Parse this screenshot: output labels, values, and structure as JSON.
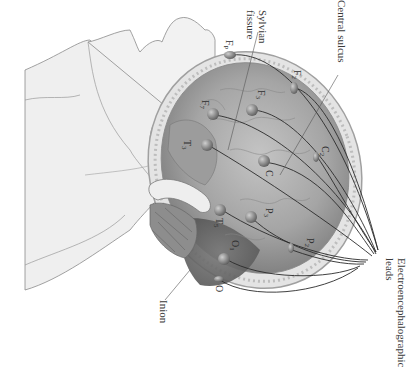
{
  "diagram": {
    "orientation": "rotated 90 degrees clockwise",
    "annotations": [
      {
        "id": "central-sulcus",
        "label": "Central sulcus"
      },
      {
        "id": "sylvian-fissure",
        "label": "Sylvian fissure",
        "lines": [
          "Sylvian",
          "fissure"
        ]
      },
      {
        "id": "eeg-leads",
        "label": "Electroencephalographic leads",
        "lines": [
          "Electroencephalographic",
          "leads"
        ]
      },
      {
        "id": "inion",
        "label": "Inion"
      }
    ],
    "electrodes": [
      {
        "id": "fp",
        "base": "F",
        "sub": "P"
      },
      {
        "id": "f2",
        "base": "F",
        "sub": "2"
      },
      {
        "id": "f3",
        "base": "F",
        "sub": "3"
      },
      {
        "id": "f7",
        "base": "F",
        "sub": "7"
      },
      {
        "id": "t3",
        "base": "T",
        "sub": "3"
      },
      {
        "id": "c",
        "base": "C",
        "sub": ""
      },
      {
        "id": "c2",
        "base": "C",
        "sub": "2"
      },
      {
        "id": "t5",
        "base": "T",
        "sub": "5"
      },
      {
        "id": "p3",
        "base": "P",
        "sub": "3"
      },
      {
        "id": "p2",
        "base": "P",
        "sub": "2"
      },
      {
        "id": "o1",
        "base": "O",
        "sub": "1"
      },
      {
        "id": "o",
        "base": "O",
        "sub": ""
      }
    ],
    "colors": {
      "skin": "#f1f1f1",
      "skin_outline": "#8a8a8a",
      "brain_light": "#b9b9b9",
      "brain_dark": "#6e6e6e",
      "skull_band": "#d8d8d8",
      "lead_wire": "#2a2a2a",
      "electrode": "#7a7a7a"
    }
  }
}
